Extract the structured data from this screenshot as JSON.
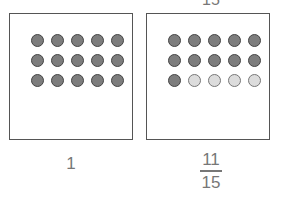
{
  "top_cutoff_text": "15",
  "panels": [
    {
      "label": "1",
      "label_type": "whole",
      "dots": [
        "filled",
        "filled",
        "filled",
        "filled",
        "filled",
        "filled",
        "filled",
        "filled",
        "filled",
        "filled",
        "filled",
        "filled",
        "filled",
        "filled",
        "filled"
      ]
    },
    {
      "label_numerator": "11",
      "label_denominator": "15",
      "label_type": "fraction",
      "dots": [
        "filled",
        "filled",
        "filled",
        "filled",
        "filled",
        "filled",
        "filled",
        "filled",
        "filled",
        "filled",
        "filled",
        "empty",
        "empty",
        "empty",
        "empty"
      ]
    }
  ],
  "colors": {
    "filled": "#7d7d7d",
    "empty": "#dcdcdc",
    "border": "#555555"
  }
}
